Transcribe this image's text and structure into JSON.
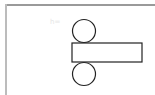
{
  "diagram": {
    "title": "",
    "watermark": "h=",
    "stroke_color": "#222222",
    "frame_color": "#9a9a9a",
    "shapes": {
      "top_circle": {
        "cx": 84,
        "cy": 31,
        "r": 11.5
      },
      "rectangle": {
        "x": 72,
        "y": 43,
        "width": 70,
        "height": 19
      },
      "bottom_circle": {
        "cx": 84,
        "cy": 74,
        "r": 11.5
      }
    }
  }
}
